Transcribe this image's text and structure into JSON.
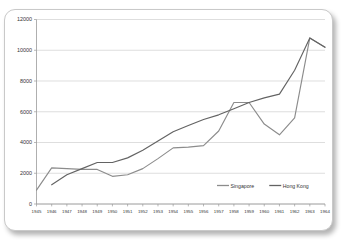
{
  "title": {
    "text": "",
    "visible_fragment": true,
    "note": "cropped at top edge"
  },
  "colors": {
    "singapore": "#8C8C8C",
    "hong_kong": "#636363",
    "gridline": "#D0D0D0",
    "axis": "#9A9A9A",
    "text": "#333333",
    "card_background": "#FFFFFF",
    "card_border": "#C9C9C9"
  },
  "chart_data": {
    "type": "line",
    "title": "",
    "xlabel": "",
    "ylabel": "",
    "ylim": [
      0,
      12000
    ],
    "ytick_step": 2000,
    "yticks": [
      "0",
      "2000",
      "4000",
      "6000",
      "8000",
      "10000",
      "12000"
    ],
    "grid": true,
    "legend_position": "inside-bottom-right",
    "categories": [
      "1945",
      "1946",
      "1947",
      "1948",
      "1949",
      "1950",
      "1951",
      "1952",
      "1953",
      "1954",
      "1955",
      "1956",
      "1957",
      "1958",
      "1959",
      "1960",
      "1961",
      "1962",
      "1963",
      "1964"
    ],
    "series": [
      {
        "name": "Singapore",
        "color": "#8C8C8C",
        "values": [
          900,
          2350,
          2300,
          2250,
          2250,
          1800,
          1900,
          2300,
          2950,
          3650,
          3700,
          3800,
          4750,
          6600,
          6600,
          5200,
          4500,
          5600,
          10800,
          10200
        ]
      },
      {
        "name": "Hong Kong",
        "color": "#636363",
        "values": [
          null,
          1250,
          1900,
          2300,
          2700,
          2700,
          3000,
          3500,
          4100,
          4700,
          5100,
          5500,
          5800,
          6200,
          6600,
          6900,
          7150,
          8700,
          10800,
          10200
        ]
      }
    ]
  },
  "legend": {
    "items": [
      {
        "label": "Singapore",
        "color": "#8C8C8C"
      },
      {
        "label": "Hong Kong",
        "color": "#636363"
      }
    ]
  }
}
